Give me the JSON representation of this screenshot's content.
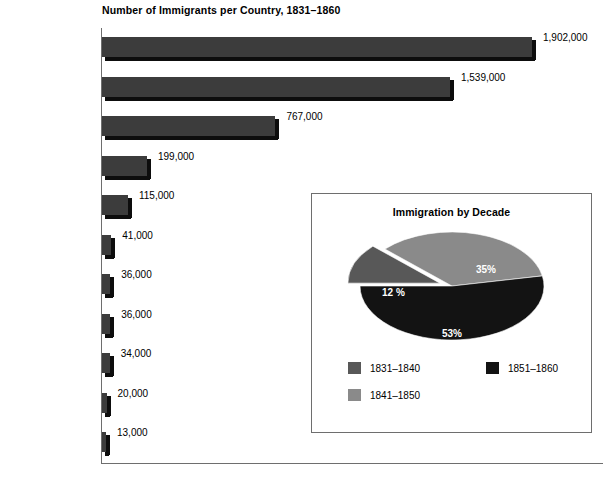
{
  "chart_data": [
    {
      "type": "bar",
      "title": "Number of Immigrants per Country, 1831–1860",
      "xlabel": "",
      "ylabel": "",
      "orientation": "horizontal",
      "grid": false,
      "xlim": [
        0,
        1902000
      ],
      "categories": [
        "Ireland",
        "German States",
        "Great Britain",
        "France",
        "Newfoundland /\nCanada",
        "China",
        "West Indies",
        "Sweden / Norway",
        "Switzerland",
        "Netherlands",
        "Mexico"
      ],
      "values": [
        1902000,
        1539000,
        767000,
        199000,
        115000,
        41000,
        36000,
        36000,
        34000,
        20000,
        13000
      ],
      "value_labels": [
        "1,902,000",
        "1,539,000",
        "767,000",
        "199,000",
        "115,000",
        "41,000",
        "36,000",
        "36,000",
        "34,000",
        "20,000",
        "13,000"
      ],
      "bar_color": "#3c3c3c",
      "bar_shadow_color": "#0d0d0d"
    },
    {
      "type": "pie",
      "title": "Immigration by Decade",
      "legend_position": "bottom",
      "labels": [
        "1831–1840",
        "1851–1860",
        "1841–1850"
      ],
      "slices": [
        {
          "label": "1831–1840",
          "value": 12,
          "display": "12 %",
          "color": "#585858",
          "exploded": true
        },
        {
          "label": "1841–1850",
          "value": 35,
          "display": "35%",
          "color": "#8a8a8a",
          "exploded": false
        },
        {
          "label": "1851–1860",
          "value": 53,
          "display": "53%",
          "color": "#131313",
          "exploded": false
        }
      ],
      "legend_entries": [
        {
          "label": "1831–1840",
          "color": "#585858"
        },
        {
          "label": "1851–1860",
          "color": "#131313"
        },
        {
          "label": "1841–1850",
          "color": "#8a8a8a"
        }
      ]
    }
  ]
}
